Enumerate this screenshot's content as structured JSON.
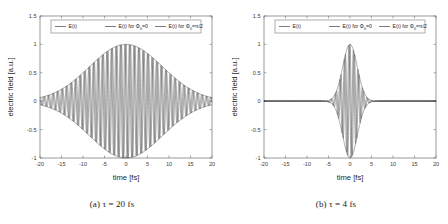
{
  "figure": {
    "background": "#ffffff",
    "line_color": "#5a5a5a",
    "envelope_color": "#555555",
    "axis_color": "#6e6e6e"
  },
  "chart_data": [
    {
      "type": "line",
      "panel_id": "a",
      "caption": "(a) τ = 20 fs",
      "title": "",
      "xlabel": "time [fs]",
      "ylabel": "electric field [a.u.]",
      "xlim": [
        -20,
        20
      ],
      "ylim": [
        -1,
        1.5
      ],
      "xticks": [
        -20,
        -15,
        -10,
        -5,
        0,
        5,
        10,
        15,
        20
      ],
      "xticklabels": [
        "-20",
        "-15",
        "-10",
        "-5",
        "0",
        "5",
        "10",
        "15",
        "20"
      ],
      "yticks": [
        -1,
        -0.5,
        0,
        0.5,
        1,
        1.5
      ],
      "yticklabels": [
        "-1",
        "-0.5",
        "0",
        "0.5",
        "1",
        "1.5"
      ],
      "grid": false,
      "legend_position": "upper-center",
      "legend": [
        {
          "label": "E(t)",
          "sub": "",
          "tail": "",
          "color": "#5a5a5a"
        },
        {
          "label": "E(t) for Φ",
          "sub": "0",
          "tail": "=0",
          "color": "#5a5a5a"
        },
        {
          "label": "E(t) for Φ",
          "sub": "0",
          "tail": "=π/2",
          "color": "#5a5a5a"
        }
      ],
      "pulse": {
        "tau_fs": 20,
        "amplitude": 1,
        "period_fs": 1.05,
        "envelope_type": "gaussian",
        "phases_rad": [
          0,
          1.5707963
        ],
        "samples": 3000
      },
      "series": [
        {
          "name": "envelope-upper",
          "role": "envelope",
          "sign": 1
        },
        {
          "name": "envelope-lower",
          "role": "envelope",
          "sign": -1
        },
        {
          "name": "E(t) for Φ₀=0",
          "role": "oscillation",
          "phase": 0
        },
        {
          "name": "E(t) for Φ₀=π/2",
          "role": "oscillation",
          "phase": 1.5707963
        }
      ]
    },
    {
      "type": "line",
      "panel_id": "b",
      "caption": "(b) τ = 4 fs",
      "title": "",
      "xlabel": "time [fs]",
      "ylabel": "electric field [a.u.]",
      "xlim": [
        -20,
        20
      ],
      "ylim": [
        -1,
        1.5
      ],
      "xticks": [
        -20,
        -15,
        -10,
        -5,
        0,
        5,
        10,
        15,
        20
      ],
      "xticklabels": [
        "-20",
        "-15",
        "-10",
        "-5",
        "0",
        "5",
        "10",
        "15",
        "20"
      ],
      "yticks": [
        -1,
        -0.5,
        0,
        0.5,
        1,
        1.5
      ],
      "yticklabels": [
        "-1",
        "-0.5",
        "0",
        "0.5",
        "1",
        "1.5"
      ],
      "grid": false,
      "legend_position": "upper-center",
      "legend": [
        {
          "label": "E(t)",
          "sub": "",
          "tail": "",
          "color": "#5a5a5a"
        },
        {
          "label": "E(t) for Φ",
          "sub": "0",
          "tail": "=0",
          "color": "#5a5a5a"
        },
        {
          "label": "E(t) for Φ",
          "sub": "0",
          "tail": "=π/2",
          "color": "#5a5a5a"
        }
      ],
      "pulse": {
        "tau_fs": 4,
        "amplitude": 1,
        "period_fs": 1.05,
        "envelope_type": "gaussian",
        "phases_rad": [
          0,
          1.5707963
        ],
        "samples": 3000
      },
      "series": [
        {
          "name": "envelope-upper",
          "role": "envelope",
          "sign": 1
        },
        {
          "name": "envelope-lower",
          "role": "envelope",
          "sign": -1
        },
        {
          "name": "E(t) for Φ₀=0",
          "role": "oscillation",
          "phase": 0
        },
        {
          "name": "E(t) for Φ₀=π/2",
          "role": "oscillation",
          "phase": 1.5707963
        }
      ]
    }
  ]
}
